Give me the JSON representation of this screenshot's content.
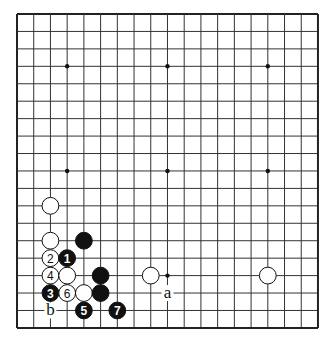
{
  "board": {
    "size": 19,
    "origin": {
      "x": 17,
      "y": 14
    },
    "spacing": {
      "x": 16.72,
      "y": 17.44
    },
    "line_color": "#333333",
    "border_color": "#222222",
    "background": "#ffffff",
    "star_points": [
      [
        3,
        3
      ],
      [
        9,
        3
      ],
      [
        15,
        3
      ],
      [
        3,
        9
      ],
      [
        9,
        9
      ],
      [
        15,
        9
      ],
      [
        3,
        15
      ],
      [
        9,
        15
      ],
      [
        15,
        15
      ]
    ]
  },
  "stones": [
    {
      "color": "white",
      "col": 2,
      "row": 11,
      "label": ""
    },
    {
      "color": "white",
      "col": 2,
      "row": 13,
      "label": ""
    },
    {
      "color": "black",
      "col": 4,
      "row": 13,
      "label": ""
    },
    {
      "color": "white",
      "col": 2,
      "row": 14,
      "label": "2"
    },
    {
      "color": "black",
      "col": 3,
      "row": 14,
      "label": "1"
    },
    {
      "color": "white",
      "col": 2,
      "row": 15,
      "label": "4"
    },
    {
      "color": "white",
      "col": 3,
      "row": 15,
      "label": ""
    },
    {
      "color": "black",
      "col": 5,
      "row": 15,
      "label": ""
    },
    {
      "color": "black",
      "col": 2,
      "row": 16,
      "label": "3"
    },
    {
      "color": "white",
      "col": 3,
      "row": 16,
      "label": "6"
    },
    {
      "color": "white",
      "col": 4,
      "row": 16,
      "label": ""
    },
    {
      "color": "black",
      "col": 5,
      "row": 16,
      "label": ""
    },
    {
      "color": "black",
      "col": 4,
      "row": 17,
      "label": "5"
    },
    {
      "color": "black",
      "col": 6,
      "row": 17,
      "label": "7"
    },
    {
      "color": "white",
      "col": 8,
      "row": 15,
      "label": ""
    },
    {
      "color": "white",
      "col": 15,
      "row": 15,
      "label": ""
    }
  ],
  "markers": [
    {
      "col": 9,
      "row": 16,
      "label": "a"
    },
    {
      "col": 2,
      "row": 17,
      "label": "b"
    }
  ]
}
